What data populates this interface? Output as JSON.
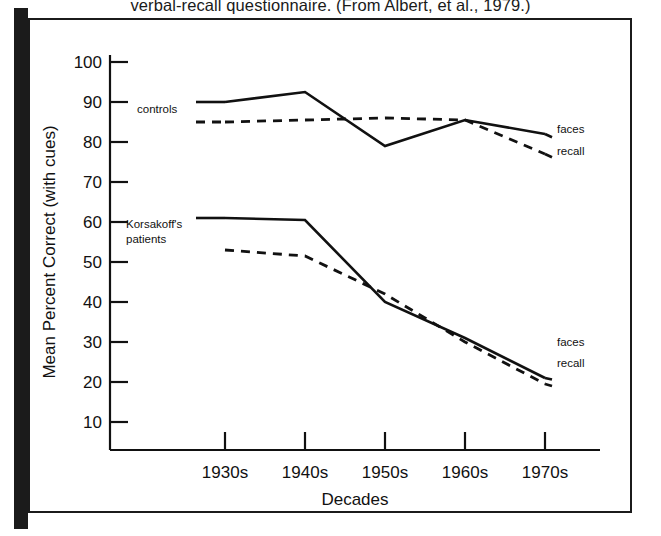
{
  "caption": {
    "text": "verbal-recall questionnaire.  (From Albert, et al., 1979.)"
  },
  "figure": {
    "frame_color": "#1b1b1b",
    "background_color": "#ffffff",
    "line_color": "#111111"
  },
  "chart_data": {
    "type": "line",
    "title": "",
    "xlabel": "Decades",
    "ylabel": "Mean Percent Correct (with cues)",
    "categories": [
      "1930s",
      "1940s",
      "1950s",
      "1960s",
      "1970s"
    ],
    "ylim": [
      0,
      100
    ],
    "yticks": [
      10,
      20,
      30,
      40,
      50,
      60,
      70,
      80,
      90,
      100
    ],
    "ytick_labels": [
      "10",
      "20",
      "30",
      "40",
      "50",
      "60",
      "70",
      "80",
      "90",
      "100"
    ],
    "grid": false,
    "legend_position": "inline-annotations",
    "series": [
      {
        "name": "controls faces",
        "group": "controls",
        "measure": "faces",
        "style": "solid",
        "values": [
          90,
          92.5,
          79,
          85.5,
          82
        ]
      },
      {
        "name": "controls recall",
        "group": "controls",
        "measure": "recall",
        "style": "dashed",
        "values": [
          85,
          85.5,
          86,
          85.5,
          77
        ]
      },
      {
        "name": "Korsakoff's patients faces",
        "group": "Korsakoff's patients",
        "measure": "faces",
        "style": "solid",
        "values": [
          61,
          60.5,
          40,
          31,
          21
        ]
      },
      {
        "name": "Korsakoff's patients recall",
        "group": "Korsakoff's patients",
        "measure": "recall",
        "style": "dashed",
        "values": [
          53,
          51.5,
          42,
          30,
          19.5
        ]
      }
    ],
    "annotations": [
      {
        "id": "controls-group",
        "text": "controls"
      },
      {
        "id": "korsakoff-line1",
        "text": "Korsakoff's"
      },
      {
        "id": "korsakoff-line2",
        "text": "patients"
      },
      {
        "id": "controls-faces",
        "text": "faces"
      },
      {
        "id": "controls-recall",
        "text": "recall"
      },
      {
        "id": "korsakoff-faces",
        "text": "faces"
      },
      {
        "id": "korsakoff-recall",
        "text": "recall"
      }
    ]
  }
}
